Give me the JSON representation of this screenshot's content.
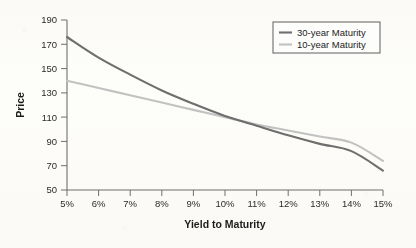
{
  "chart_data": {
    "type": "line",
    "title": "",
    "xlabel": "Yield to Maturity",
    "ylabel": "Price",
    "xlim": [
      5,
      15
    ],
    "ylim": [
      50,
      190
    ],
    "grid": false,
    "legend_position": "top-right",
    "x": [
      5,
      6,
      7,
      8,
      9,
      10,
      11,
      12,
      13,
      14,
      15
    ],
    "xtick_labels": [
      "5%",
      "6%",
      "7%",
      "8%",
      "9%",
      "10%",
      "11%",
      "12%",
      "13%",
      "14%",
      "15%"
    ],
    "ytick_labels": [
      "50",
      "70",
      "90",
      "110",
      "130",
      "150",
      "170",
      "190"
    ],
    "ytick_values": [
      50,
      70,
      90,
      110,
      130,
      150,
      170,
      190
    ],
    "series": [
      {
        "name": "30-year Maturity",
        "color": "#6e6e6e",
        "values": [
          176,
          159,
          145,
          132,
          121,
          111,
          103,
          95,
          88,
          82,
          66
        ]
      },
      {
        "name": "10-year Maturity",
        "color": "#c2c2c2",
        "values": [
          140,
          134,
          128,
          122,
          116,
          110,
          104,
          99,
          94,
          89,
          74
        ]
      }
    ],
    "annotations": []
  },
  "legend": {
    "entries": [
      {
        "label": "30-year Maturity",
        "color": "#6e6e6e"
      },
      {
        "label": "10-year Maturity",
        "color": "#c2c2c2"
      }
    ]
  },
  "axes": {
    "x_title": "Yield to Maturity",
    "y_title": "Price"
  }
}
